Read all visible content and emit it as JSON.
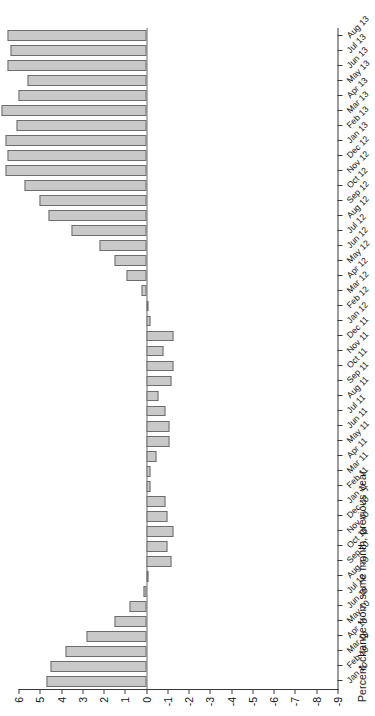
{
  "chart": {
    "type": "bar",
    "orientation": "rotated-90",
    "ylabel": "Percent change from same month, previous year",
    "xlabel": "",
    "title": "",
    "grid": false,
    "legend": false,
    "ylim": [
      -9,
      6
    ],
    "yticks": [
      6,
      5,
      4,
      3,
      2,
      1,
      0,
      -1,
      -2,
      -3,
      -4,
      -5,
      -6,
      -7,
      -8,
      -9
    ],
    "ytick_labels": [
      "6",
      "5",
      "4",
      "3",
      "2",
      "1",
      "0",
      "-1",
      "-2",
      "-3",
      "-4",
      "-5",
      "-6",
      "-7",
      "-8",
      "-9"
    ]
  },
  "chart_data": {
    "type": "bar",
    "title": "",
    "xlabel": "",
    "ylabel": "Percent change from same month, previous year",
    "ylim": [
      -9,
      6
    ],
    "grid": false,
    "legend_position": "none",
    "categories": [
      "Jan 10",
      "Feb 10",
      "Mar 10",
      "Apr 10",
      "May 10",
      "Jun 10",
      "Jul 10",
      "Aug 10",
      "Sep 10",
      "Oct 10",
      "Nov 10",
      "Dec 10",
      "Jan 11",
      "Feb 11",
      "Mar 11",
      "Apr 11",
      "May 11",
      "Jun 11",
      "Jul 11",
      "Aug 11",
      "Sep 11",
      "Oct 11",
      "Nov 11",
      "Dec 11",
      "Jan 12",
      "Feb 12",
      "Mar 12",
      "Apr 12",
      "May 12",
      "Jun 12",
      "Jul 12",
      "Aug 12",
      "Sep 12",
      "Oct 12",
      "Nov 12",
      "Dec 12",
      "Jan 13",
      "Feb 13",
      "Mar 13",
      "Apr 13",
      "May 13",
      "Jun 13",
      "Jul 13",
      "Aug 13"
    ],
    "values": [
      4.7,
      4.5,
      3.8,
      2.8,
      1.5,
      0.8,
      0.1,
      -0.1,
      -1.2,
      -1.0,
      -1.3,
      -1.0,
      -0.9,
      -0.2,
      -0.2,
      -0.5,
      -1.1,
      -1.1,
      -0.9,
      -0.6,
      -1.2,
      -1.3,
      -0.8,
      -1.3,
      -0.2,
      -0.1,
      0.2,
      0.9,
      1.5,
      2.2,
      3.5,
      4.6,
      5.0,
      5.7,
      6.6,
      6.5,
      6.6,
      6.1,
      6.8,
      6.0,
      5.6,
      6.5,
      6.4,
      6.5
    ],
    "values_note": "positive values plot left of zero, negative values plot right of zero"
  },
  "style": {
    "bar_fill": "#c9c9c9",
    "bar_edge": "#6d6d6d",
    "axis_color": "#3a3a3a",
    "background": "#ffffff",
    "text_color": "#111111"
  }
}
